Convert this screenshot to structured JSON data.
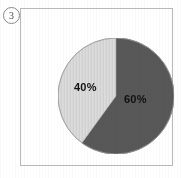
{
  "figure": {
    "number_label": "3",
    "marker_icon": "circled-number-icon"
  },
  "chart_data": {
    "type": "pie",
    "title": "",
    "subtitle": "",
    "xlabel": "",
    "ylabel": "",
    "grid": false,
    "legend": "none",
    "start_angle_deg": 0,
    "direction": "clockwise",
    "categories": [
      "60%",
      "40%"
    ],
    "values": [
      60,
      40
    ],
    "labels": [
      "60%",
      "40%"
    ],
    "colors": [
      "#585858",
      "#d8d8d8"
    ],
    "slices": [
      {
        "name": "dark-slice",
        "label": "60%",
        "value": 60,
        "color": "#585858",
        "start_angle_deg": 0,
        "end_angle_deg": 216,
        "fill_pattern": "solid"
      },
      {
        "name": "light-slice",
        "label": "40%",
        "value": 40,
        "color": "#d8d8d8",
        "start_angle_deg": 216,
        "end_angle_deg": 360,
        "fill_pattern": "vertical-hairlines"
      }
    ],
    "annotations": []
  },
  "style": {
    "background": "#ffffff",
    "frame_border": "#b9b9b9",
    "pie_outline": "#8e8e8e",
    "label_color": "#111111"
  }
}
